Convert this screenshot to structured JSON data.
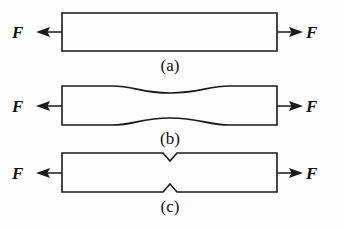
{
  "figure": {
    "background_color": "#fefefe",
    "line_color": "#1a1a1a",
    "fill_color": "#fdfdfd",
    "specimens": [
      {
        "id": "a",
        "caption": "(a)",
        "shape": "uniform-prismatic-bar",
        "left_force_label": "F",
        "right_force_label": "F",
        "caption_x": 170,
        "caption_y": 71,
        "bar_left": 62,
        "bar_right": 277,
        "bar_top": 13,
        "bar_bottom": 51
      },
      {
        "id": "b",
        "caption": "(b)",
        "shape": "filleted-waisted-bar",
        "left_force_label": "F",
        "right_force_label": "F",
        "caption_x": 170,
        "caption_y": 144,
        "bar_left": 62,
        "bar_right": 277,
        "bar_top": 86,
        "bar_bottom": 125,
        "fillet_start_x": 112,
        "fillet_end_x": 230,
        "waist_depth": 7
      },
      {
        "id": "c",
        "caption": "(c)",
        "shape": "v-notched-bar",
        "left_force_label": "F",
        "right_force_label": "F",
        "caption_x": 170,
        "caption_y": 212,
        "bar_left": 62,
        "bar_right": 277,
        "bar_top": 153,
        "bar_bottom": 192,
        "notch_center_x": 170,
        "notch_half_width": 7,
        "notch_depth": 8
      }
    ],
    "force_arrows": [
      {
        "specimen": "a",
        "side": "left",
        "label": "F",
        "label_x": 18,
        "label_y": 38,
        "tip_x": 37,
        "tail_x": 62,
        "y": 32
      },
      {
        "specimen": "a",
        "side": "right",
        "label": "F",
        "label_x": 311,
        "label_y": 38,
        "tip_x": 302,
        "tail_x": 277,
        "y": 32
      },
      {
        "specimen": "b",
        "side": "left",
        "label": "F",
        "label_x": 18,
        "label_y": 112,
        "tip_x": 37,
        "tail_x": 62,
        "y": 106
      },
      {
        "specimen": "b",
        "side": "right",
        "label": "F",
        "label_x": 311,
        "label_y": 112,
        "tip_x": 302,
        "tail_x": 277,
        "y": 106
      },
      {
        "specimen": "c",
        "side": "left",
        "label": "F",
        "label_x": 18,
        "label_y": 179,
        "tip_x": 37,
        "tail_x": 62,
        "y": 173
      },
      {
        "specimen": "c",
        "side": "right",
        "label": "F",
        "label_x": 311,
        "label_y": 179,
        "tip_x": 302,
        "tail_x": 277,
        "y": 173
      }
    ]
  }
}
